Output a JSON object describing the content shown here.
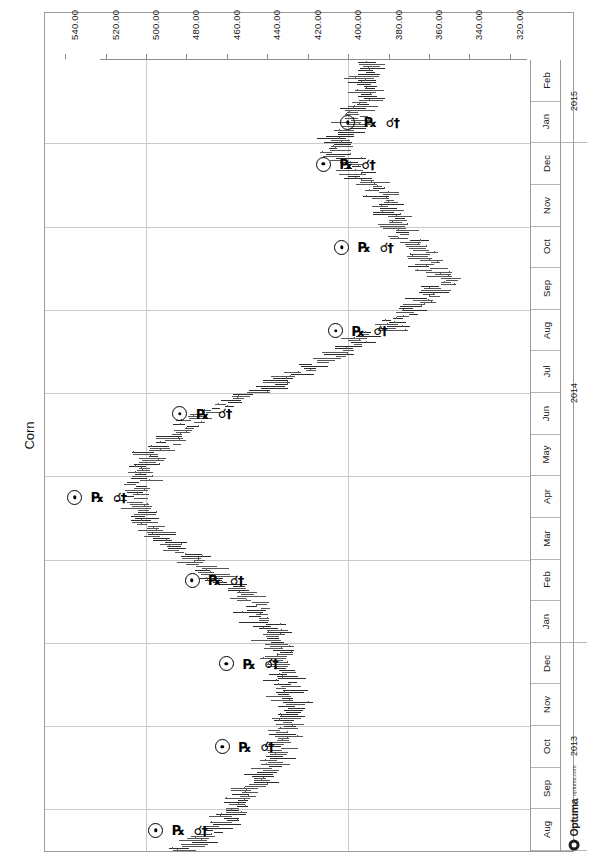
{
  "chart": {
    "title": "Corn",
    "watermark": {
      "brand": "Optuma",
      "url": "optuma.com",
      "mark_icon": "optuma-circle-icon"
    }
  },
  "chart_data": {
    "type": "line",
    "title": "Corn",
    "orientation": "rotated-90",
    "xlabel": "",
    "ylabel": "",
    "grid": true,
    "legend": null,
    "value_axis": {
      "ticks": [
        "540.00",
        "520.00",
        "500.00",
        "480.00",
        "460.00",
        "440.00",
        "420.00",
        "400.00",
        "380.00",
        "360.00",
        "340.00",
        "320.00"
      ],
      "values": [
        540,
        520,
        500,
        480,
        460,
        440,
        420,
        400,
        380,
        360,
        340,
        320
      ],
      "range": [
        550,
        310
      ],
      "direction": "descending-left-to-right"
    },
    "date_axis": {
      "months": [
        "Feb",
        "Jan",
        "Dec",
        "Nov",
        "Oct",
        "Sep",
        "Aug",
        "Jul",
        "Jun",
        "May",
        "Apr",
        "Mar",
        "Feb",
        "Jan",
        "Dec",
        "Nov",
        "Oct",
        "Sep",
        "Aug"
      ],
      "years": [
        {
          "label": "2015",
          "span_months": 2
        },
        {
          "label": "2014",
          "span_months": 12
        },
        {
          "label": "2013",
          "span_months": 5
        }
      ]
    },
    "series": [
      {
        "name": "Corn OHLC",
        "note": "Monthly-to-weekly bar series; approximate price by month",
        "points": [
          {
            "date": "2013-08",
            "price": 480
          },
          {
            "date": "2013-09",
            "price": 455
          },
          {
            "date": "2013-10",
            "price": 438
          },
          {
            "date": "2013-11",
            "price": 428
          },
          {
            "date": "2013-12",
            "price": 432
          },
          {
            "date": "2014-01",
            "price": 438
          },
          {
            "date": "2014-02",
            "price": 455
          },
          {
            "date": "2014-03",
            "price": 488
          },
          {
            "date": "2014-04",
            "price": 508
          },
          {
            "date": "2014-05",
            "price": 498
          },
          {
            "date": "2014-06",
            "price": 470
          },
          {
            "date": "2014-07",
            "price": 420
          },
          {
            "date": "2014-08",
            "price": 378
          },
          {
            "date": "2014-09",
            "price": 352
          },
          {
            "date": "2014-10",
            "price": 372
          },
          {
            "date": "2014-11",
            "price": 385
          },
          {
            "date": "2014-12",
            "price": 408
          },
          {
            "date": "2015-01",
            "price": 392
          },
          {
            "date": "2015-02",
            "price": 388
          }
        ]
      }
    ],
    "annotations": [
      {
        "type": "aspect-marker",
        "label": "sun-conjunction",
        "date": "2013-08",
        "price": 495,
        "glyphs": [
          "sun",
          "retrograde",
          "conjunction"
        ]
      },
      {
        "type": "aspect-marker",
        "label": "sun-conjunction",
        "date": "2013-10",
        "price": 462,
        "glyphs": [
          "sun",
          "retrograde",
          "conjunction"
        ]
      },
      {
        "type": "aspect-marker",
        "label": "sun-conjunction",
        "date": "2013-12",
        "price": 460,
        "glyphs": [
          "sun",
          "retrograde",
          "conjunction"
        ]
      },
      {
        "type": "aspect-marker",
        "label": "sun-conjunction",
        "date": "2014-02",
        "price": 477,
        "glyphs": [
          "sun",
          "retrograde",
          "conjunction"
        ]
      },
      {
        "type": "aspect-marker",
        "label": "sun-conjunction",
        "date": "2014-06",
        "price": 483,
        "glyphs": [
          "sun",
          "retrograde",
          "conjunction"
        ]
      },
      {
        "type": "aspect-marker",
        "label": "sun-conjunction",
        "date": "2014-04",
        "price": 535,
        "glyphs": [
          "sun",
          "retrograde",
          "conjunction"
        ]
      },
      {
        "type": "aspect-marker",
        "label": "sun-conjunction",
        "date": "2014-08",
        "price": 406,
        "glyphs": [
          "sun",
          "retrograde",
          "conjunction"
        ]
      },
      {
        "type": "aspect-marker",
        "label": "sun-conjunction",
        "date": "2014-10",
        "price": 403,
        "glyphs": [
          "sun",
          "retrograde",
          "conjunction"
        ]
      },
      {
        "type": "aspect-marker",
        "label": "sun-conjunction",
        "date": "2014-12",
        "price": 412,
        "glyphs": [
          "sun",
          "retrograde",
          "conjunction"
        ]
      },
      {
        "type": "aspect-marker",
        "label": "sun-conjunction",
        "date": "2015-01",
        "price": 400,
        "glyphs": [
          "sun",
          "retrograde",
          "conjunction"
        ]
      }
    ]
  },
  "glyph_chars": {
    "sun": "⊙",
    "retrograde": "℞",
    "conjunction": "☌"
  }
}
